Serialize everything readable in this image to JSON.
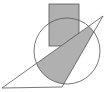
{
  "diagram": {
    "type": "geometry",
    "colors": {
      "stroke": "#555555",
      "fill": "#b0b0b0",
      "background": "#ffffff"
    },
    "rectangle": {
      "x": 49,
      "y": 4,
      "width": 30,
      "height": 42
    },
    "circle": {
      "cx": 67,
      "cy": 51,
      "r": 33
    },
    "triangle": {
      "points": "2,88 62,87 103,16"
    }
  }
}
